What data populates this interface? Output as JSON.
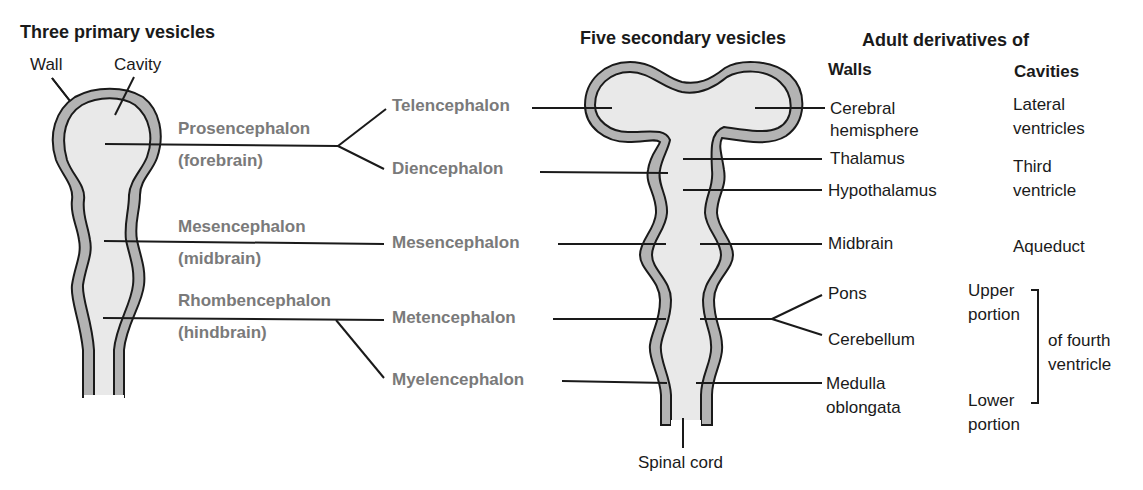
{
  "headings": {
    "primary": "Three primary vesicles",
    "secondary": "Five secondary vesicles",
    "adult": "Adult derivatives of",
    "walls": "Walls",
    "cavities": "Cavities"
  },
  "primary_parts": {
    "wall": "Wall",
    "cavity": "Cavity"
  },
  "primary_vesicles": [
    {
      "name": "Prosencephalon",
      "common": "(forebrain)"
    },
    {
      "name": "Mesencephalon",
      "common": "(midbrain)"
    },
    {
      "name": "Rhombencephalon",
      "common": "(hindbrain)"
    }
  ],
  "secondary_vesicles": [
    {
      "name": "Telencephalon"
    },
    {
      "name": "Diencephalon"
    },
    {
      "name": "Mesencephalon"
    },
    {
      "name": "Metencephalon"
    },
    {
      "name": "Myelencephalon"
    }
  ],
  "walls": {
    "cerebral_1": "Cerebral",
    "cerebral_2": "hemisphere",
    "thalamus": "Thalamus",
    "hypothalamus": "Hypothalamus",
    "midbrain": "Midbrain",
    "pons": "Pons",
    "cerebellum": "Cerebellum",
    "medulla_1": "Medulla",
    "medulla_2": "oblongata"
  },
  "cavities": {
    "lateral_1": "Lateral",
    "lateral_2": "ventricles",
    "third_1": "Third",
    "third_2": "ventricle",
    "aqueduct": "Aqueduct",
    "upper_1": "Upper",
    "upper_2": "portion",
    "lower_1": "Lower",
    "lower_2": "portion",
    "fourth_1": "of fourth",
    "fourth_2": "ventricle"
  },
  "spinal_cord": "Spinal cord",
  "colors": {
    "wall_fill": "#b3b3b3",
    "cavity_fill": "#e9e9e9",
    "outline": "#1a1a1a",
    "vesicle_label": "#7a7a7a"
  }
}
